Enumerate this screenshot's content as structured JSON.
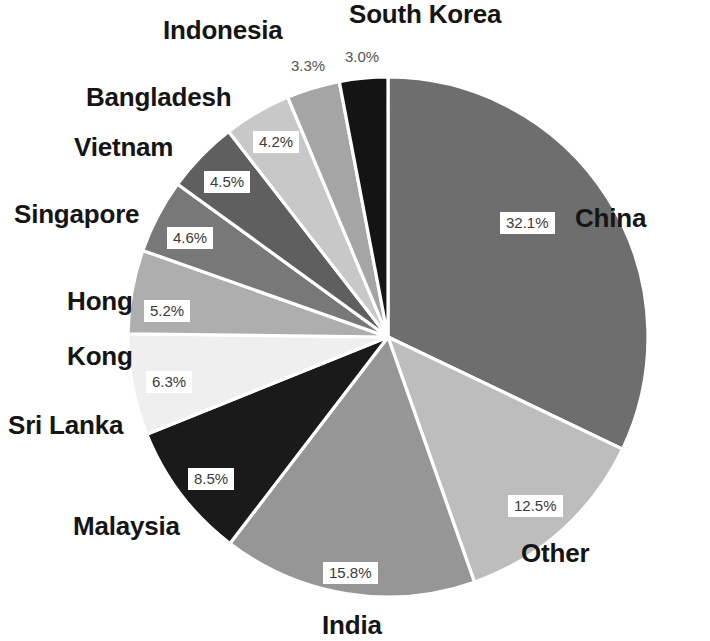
{
  "chart_data": {
    "type": "pie",
    "title": "",
    "subtitle": "",
    "legend_position": "outside-labels",
    "grid": false,
    "categories": [
      "China",
      "Other",
      "India",
      "Malaysia",
      "Sri Lanka",
      "Hong Kong",
      "Singapore",
      "Vietnam",
      "Bangladesh",
      "Indonesia",
      "South Korea"
    ],
    "values": [
      32.1,
      12.5,
      15.8,
      8.5,
      6.3,
      5.2,
      4.6,
      4.5,
      4.2,
      3.3,
      3.0
    ],
    "value_labels": [
      "32.1%",
      "12.5%",
      "15.8%",
      "8.5%",
      "6.3%",
      "5.2%",
      "4.6%",
      "4.5%",
      "4.2%",
      "3.3%",
      "3.0%"
    ],
    "units": "percent",
    "xlabel": "",
    "ylabel": "",
    "slice_colors": [
      "#6e6e6e",
      "#bdbdbd",
      "#969696",
      "#1a1a1a",
      "#efefef",
      "#aeaeae",
      "#787878",
      "#5f5f5f",
      "#c8c8c8",
      "#a5a5a5",
      "#141414"
    ],
    "start_angle_deg": -90,
    "direction": "clockwise",
    "separator_color": "#ffffff"
  },
  "slices": [
    {
      "name": "China",
      "pct": "32.1%",
      "label": "China",
      "color": "#6e6e6e",
      "value": 32.1
    },
    {
      "name": "Other",
      "pct": "12.5%",
      "label": "Other",
      "color": "#bdbdbd",
      "value": 12.5
    },
    {
      "name": "India",
      "pct": "15.8%",
      "label": "India",
      "color": "#969696",
      "value": 15.8
    },
    {
      "name": "Malaysia",
      "pct": "8.5%",
      "label": "Malaysia",
      "color": "#1a1a1a",
      "value": 8.5
    },
    {
      "name": "Sri Lanka",
      "pct": "6.3%",
      "label": "Sri Lanka",
      "color": "#efefef",
      "value": 6.3
    },
    {
      "name": "Hong Kong",
      "pct": "5.2%",
      "label_line1": "Hong",
      "label_line2": "Kong",
      "label": "Hong\nKong",
      "color": "#aeaeae",
      "value": 5.2
    },
    {
      "name": "Singapore",
      "pct": "4.6%",
      "label": "Singapore",
      "color": "#787878",
      "value": 4.6
    },
    {
      "name": "Vietnam",
      "pct": "4.5%",
      "label": "Vietnam",
      "color": "#5f5f5f",
      "value": 4.5
    },
    {
      "name": "Bangladesh",
      "pct": "4.2%",
      "label": "Bangladesh",
      "color": "#c8c8c8",
      "value": 4.2
    },
    {
      "name": "Indonesia",
      "pct": "3.3%",
      "label": "Indonesia",
      "color": "#a5a5a5",
      "value": 3.3
    },
    {
      "name": "South Korea",
      "pct": "3.0%",
      "label": "South Korea",
      "color": "#141414",
      "value": 3.0
    }
  ],
  "colors": {
    "background": "#ffffff",
    "label_text": "#151515",
    "pct_text": "#3a3a3a",
    "separator": "#ffffff"
  }
}
